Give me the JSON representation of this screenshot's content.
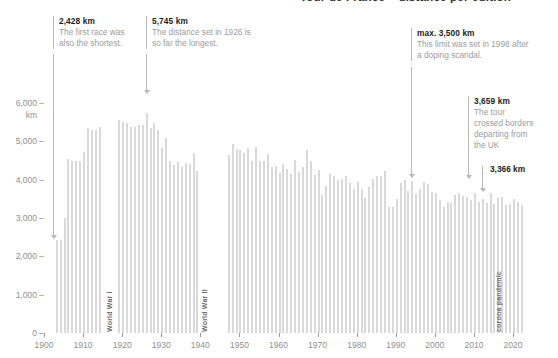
{
  "title": "Tour de France – distance per edition",
  "axes": {
    "y_label_unit": "km",
    "y_ticks": [
      {
        "label": "6,000 –",
        "value": 6000
      },
      {
        "label": "5,000 –",
        "value": 5000
      },
      {
        "label": "4,000 –",
        "value": 4000
      },
      {
        "label": "3,000 –",
        "value": 3000
      },
      {
        "label": "2,000 –",
        "value": 2000
      },
      {
        "label": "1,000 –",
        "value": 1000
      },
      {
        "label": "0 –",
        "value": 0
      }
    ],
    "x_ticks": [
      "1900",
      "1910",
      "1920",
      "1930",
      "1940",
      "1950",
      "1960",
      "1970",
      "1980",
      "1990",
      "2000",
      "2010",
      "2020"
    ]
  },
  "event_labels": [
    {
      "text": "World War I"
    },
    {
      "text": "World War II"
    },
    {
      "text": "corona pandemic"
    }
  ],
  "callouts": [
    {
      "value": "2,428 km",
      "text": "The first race was also the shortest."
    },
    {
      "value": "5,745 km",
      "text": "The distance set in 1926 is so far the longest."
    },
    {
      "value": "max. 3,500 km",
      "text": "This limit was set in 1998 after a doping scandal."
    },
    {
      "value": "3,659 km",
      "text": "The tour crossed borders departing from the UK"
    },
    {
      "value": "3,366 km",
      "text": ""
    }
  ],
  "colors": {
    "bar": "#d9d9d9",
    "axis": "#9a9a9a",
    "tick_text": "#8f8f8f",
    "callout_value": "#1d1d1d",
    "callout_text": "#9c9c9c",
    "callout_rule": "#b9b9b9"
  },
  "chart_data": {
    "type": "bar",
    "title": "Tour de France – distance per edition",
    "xlabel": "",
    "ylabel": "km",
    "ylim": [
      0,
      6400
    ],
    "xlim": [
      1900,
      2023
    ],
    "grid": false,
    "legend": "none",
    "unit": "km",
    "note_missing_years": "No race 1915–1918 (World War I) and 1940–1946 (World War II)",
    "x": [
      1903,
      1904,
      1905,
      1906,
      1907,
      1908,
      1909,
      1910,
      1911,
      1912,
      1913,
      1914,
      1919,
      1920,
      1921,
      1922,
      1923,
      1924,
      1925,
      1926,
      1927,
      1928,
      1929,
      1930,
      1931,
      1932,
      1933,
      1934,
      1935,
      1936,
      1937,
      1938,
      1939,
      1947,
      1948,
      1949,
      1950,
      1951,
      1952,
      1953,
      1954,
      1955,
      1956,
      1957,
      1958,
      1959,
      1960,
      1961,
      1962,
      1963,
      1964,
      1965,
      1966,
      1967,
      1968,
      1969,
      1970,
      1971,
      1972,
      1973,
      1974,
      1975,
      1976,
      1977,
      1978,
      1979,
      1980,
      1981,
      1982,
      1983,
      1984,
      1985,
      1986,
      1987,
      1988,
      1989,
      1990,
      1991,
      1992,
      1993,
      1994,
      1995,
      1996,
      1997,
      1998,
      1999,
      2000,
      2001,
      2002,
      2003,
      2004,
      2005,
      2006,
      2007,
      2008,
      2009,
      2010,
      2011,
      2012,
      2013,
      2014,
      2015,
      2016,
      2017,
      2018,
      2019,
      2020,
      2021,
      2022
    ],
    "values": [
      2428,
      2420,
      2994,
      4545,
      4488,
      4497,
      4497,
      4734,
      5344,
      5289,
      5287,
      5380,
      5560,
      5503,
      5484,
      5375,
      5386,
      5425,
      5430,
      5745,
      5340,
      5476,
      5286,
      4822,
      5091,
      4479,
      4395,
      4470,
      4338,
      4442,
      4415,
      4694,
      4224,
      4640,
      4922,
      4808,
      4773,
      4690,
      4827,
      4476,
      4855,
      4495,
      4498,
      4669,
      4319,
      4358,
      4173,
      4397,
      4274,
      4138,
      4504,
      4188,
      4322,
      4779,
      4492,
      4117,
      4254,
      3608,
      3846,
      4150,
      4098,
      4000,
      4017,
      4096,
      3908,
      3765,
      3946,
      3753,
      3512,
      3809,
      4021,
      4109,
      4094,
      4231,
      3286,
      3285,
      3504,
      3914,
      3983,
      3714,
      3978,
      3635,
      3765,
      3950,
      3875,
      3687,
      3662,
      3458,
      3278,
      3427,
      3391,
      3607,
      3657,
      3570,
      3559,
      3459,
      3642,
      3430,
      3497,
      3404,
      3664,
      3360,
      3529,
      3540,
      3351,
      3366,
      3484,
      3414,
      3328
    ]
  }
}
